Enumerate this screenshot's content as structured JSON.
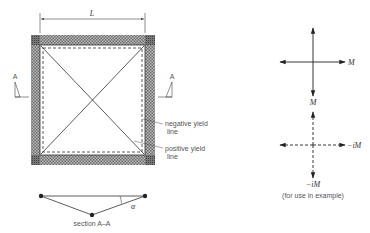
{
  "figure": {
    "slab": {
      "dimension_label": "L",
      "section_marker_left": "A",
      "section_marker_right": "A",
      "annotations": {
        "negative_yield_line": "negative yield\nline",
        "negative_yield_line_1": "negative yield",
        "negative_yield_line_2": "line",
        "positive_yield_line_1": "positive yield",
        "positive_yield_line_2": "line"
      }
    },
    "section": {
      "caption": "section A–A",
      "angle_label": "α"
    },
    "moment_symbols": {
      "positive": {
        "right_label": "M",
        "bottom_label": "M"
      },
      "negative": {
        "right_label": "−iM",
        "bottom_label": "−iM"
      },
      "caption": "(for use in example)"
    },
    "colors": {
      "hatch_dark": "#6e6e6e",
      "hatch_light": "#b5b5b5",
      "line": "#333333"
    }
  }
}
